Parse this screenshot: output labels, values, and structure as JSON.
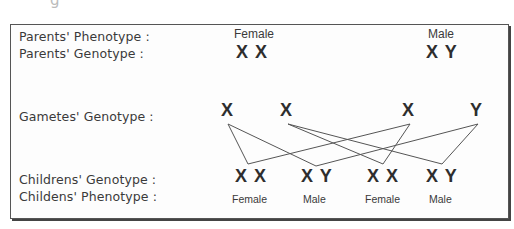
{
  "rows": {
    "parents_phenotype_label": "Parents' Phenotype :",
    "parents_genotype_label": "Parents' Genotype :",
    "gametes_genotype_label": "Gametes' Genotype :",
    "childrens_genotype_label": "Childrens' Genotype :",
    "childens_phenotype_label": "Childens' Phenotype :"
  },
  "parents": [
    {
      "phenotype": "Female",
      "genotype": "X X"
    },
    {
      "phenotype": "Male",
      "genotype": "X Y"
    }
  ],
  "gametes": [
    "X",
    "X",
    "X",
    "Y"
  ],
  "children": [
    {
      "genotype": "X X",
      "phenotype": "Female"
    },
    {
      "genotype": "X Y",
      "phenotype": "Male"
    },
    {
      "genotype": "X X",
      "phenotype": "Female"
    },
    {
      "genotype": "X Y",
      "phenotype": "Male"
    }
  ],
  "crosses": [
    {
      "gamete": 0,
      "child": 0
    },
    {
      "gamete": 0,
      "child": 1
    },
    {
      "gamete": 1,
      "child": 2
    },
    {
      "gamete": 1,
      "child": 3
    },
    {
      "gamete": 2,
      "child": 0
    },
    {
      "gamete": 2,
      "child": 2
    },
    {
      "gamete": 3,
      "child": 1
    },
    {
      "gamete": 3,
      "child": 3
    }
  ],
  "colors": {
    "line": "#555555",
    "frame": "#555555",
    "text": "#333333"
  }
}
